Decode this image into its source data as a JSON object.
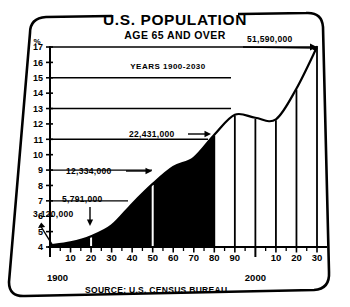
{
  "figure": {
    "title": "U.S. POPULATION",
    "subtitle": "AGE 65 AND OVER",
    "inner_note": "YEARS 1900-2030",
    "source": "SOURCE: U.S. CENSUS BUREAU",
    "y_unit_label": "%",
    "origin_year_label": "1900",
    "century_label": "2000",
    "ink_color": "#000000",
    "paper_color": "#ffffff",
    "fill_color": "#000000"
  },
  "chart_data": {
    "type": "area",
    "subtitle": "YEARS 1900-2030",
    "xlabel": "",
    "ylabel": "%",
    "ylim": [
      4,
      17
    ],
    "xlim": [
      1900,
      2030
    ],
    "grid": false,
    "y_ticks": [
      4,
      5,
      6,
      7,
      8,
      9,
      10,
      11,
      12,
      13,
      14,
      15,
      16,
      17
    ],
    "x_ticks": [
      1900,
      1910,
      1920,
      1930,
      1940,
      1950,
      1960,
      1970,
      1980,
      1990,
      2000,
      2010,
      2020,
      2030
    ],
    "x_tick_labels": [
      "1900",
      "10",
      "20",
      "30",
      "40",
      "50",
      "60",
      "70",
      "80",
      "90",
      "2000",
      "10",
      "20",
      "30"
    ],
    "series": [
      {
        "name": "Percent of U.S. population age 65 and over",
        "x": [
          1900,
          1910,
          1920,
          1930,
          1940,
          1950,
          1960,
          1970,
          1980,
          1990,
          2000,
          2010,
          2020,
          2030
        ],
        "values": [
          4.1,
          4.3,
          4.7,
          5.4,
          6.8,
          8.1,
          9.2,
          9.8,
          11.3,
          12.6,
          12.4,
          12.3,
          14.3,
          17.0
        ]
      }
    ],
    "shaded_through_year": 1980,
    "annotations": [
      {
        "label": "3,120,000",
        "year": 1900,
        "percent": 4.1,
        "note": "population age 65+ in 1900"
      },
      {
        "label": "5,791,000",
        "year": 1920,
        "percent": 4.7,
        "note": "population age 65+ in 1920"
      },
      {
        "label": "12,334,000",
        "year": 1950,
        "percent": 8.1,
        "note": "population age 65+ in 1950"
      },
      {
        "label": "22,431,000",
        "year": 1975,
        "percent": 10.5,
        "note": "population age 65+ in mid-1970s"
      },
      {
        "label": "51,590,000",
        "year": 2030,
        "percent": 17.0,
        "note": "projected population age 65+ in 2030"
      }
    ]
  }
}
